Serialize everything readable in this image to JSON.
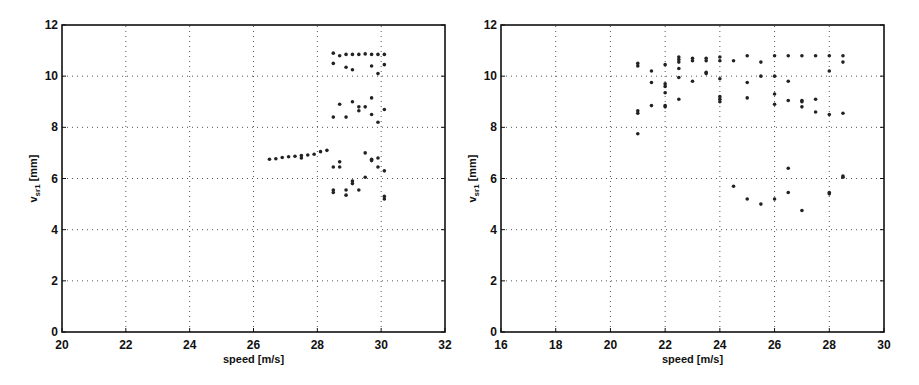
{
  "chart_data": [
    {
      "type": "scatter",
      "title": "",
      "xlabel": "speed [m/s]",
      "ylabel_main": "v",
      "ylabel_sub": "sr1",
      "ylabel_unit": "[mm]",
      "xlim": [
        20,
        32
      ],
      "ylim": [
        0,
        12
      ],
      "xticks": [
        20,
        22,
        24,
        26,
        28,
        30,
        32
      ],
      "yticks": [
        0,
        2,
        4,
        6,
        8,
        10,
        12
      ],
      "grid": true,
      "points": [
        [
          26.5,
          6.75
        ],
        [
          26.7,
          6.77
        ],
        [
          26.9,
          6.82
        ],
        [
          27.1,
          6.85
        ],
        [
          27.3,
          6.87
        ],
        [
          27.5,
          6.9
        ],
        [
          27.5,
          6.8
        ],
        [
          27.7,
          6.92
        ],
        [
          27.9,
          6.95
        ],
        [
          28.1,
          7.05
        ],
        [
          28.3,
          7.1
        ],
        [
          28.5,
          10.9
        ],
        [
          28.7,
          10.8
        ],
        [
          28.9,
          10.85
        ],
        [
          29.1,
          10.85
        ],
        [
          29.3,
          10.85
        ],
        [
          29.5,
          10.87
        ],
        [
          29.7,
          10.85
        ],
        [
          29.9,
          10.85
        ],
        [
          30.1,
          10.85
        ],
        [
          28.5,
          10.5
        ],
        [
          28.9,
          10.35
        ],
        [
          29.1,
          10.25
        ],
        [
          29.7,
          10.4
        ],
        [
          29.9,
          10.1
        ],
        [
          30.1,
          10.45
        ],
        [
          28.5,
          8.4
        ],
        [
          28.7,
          8.9
        ],
        [
          28.9,
          8.4
        ],
        [
          29.1,
          9.0
        ],
        [
          29.3,
          8.8
        ],
        [
          29.3,
          8.65
        ],
        [
          29.5,
          8.8
        ],
        [
          29.7,
          9.15
        ],
        [
          29.7,
          8.5
        ],
        [
          29.9,
          8.2
        ],
        [
          30.1,
          8.7
        ],
        [
          28.5,
          6.45
        ],
        [
          28.7,
          6.65
        ],
        [
          28.7,
          6.45
        ],
        [
          29.5,
          7.0
        ],
        [
          29.7,
          6.75
        ],
        [
          29.7,
          6.7
        ],
        [
          29.9,
          6.8
        ],
        [
          29.9,
          6.45
        ],
        [
          30.1,
          6.3
        ],
        [
          28.5,
          5.55
        ],
        [
          28.5,
          5.45
        ],
        [
          28.9,
          5.55
        ],
        [
          28.9,
          5.35
        ],
        [
          29.1,
          5.9
        ],
        [
          29.1,
          5.8
        ],
        [
          29.3,
          5.55
        ],
        [
          29.5,
          6.05
        ],
        [
          30.1,
          5.3
        ],
        [
          30.1,
          5.2
        ]
      ]
    },
    {
      "type": "scatter",
      "title": "",
      "xlabel": "speed [m/s]",
      "ylabel_main": "v",
      "ylabel_sub": "sr1",
      "ylabel_unit": "[mm]",
      "xlim": [
        16,
        30
      ],
      "ylim": [
        0,
        12
      ],
      "xticks": [
        16,
        18,
        20,
        22,
        24,
        26,
        28,
        30
      ],
      "yticks": [
        0,
        2,
        4,
        6,
        8,
        10,
        12
      ],
      "grid": true,
      "points": [
        [
          21,
          10.5
        ],
        [
          21,
          10.4
        ],
        [
          21,
          8.65
        ],
        [
          21,
          8.55
        ],
        [
          21,
          7.75
        ],
        [
          21.5,
          10.2
        ],
        [
          21.5,
          9.75
        ],
        [
          21.5,
          8.85
        ],
        [
          22,
          10.45
        ],
        [
          22,
          9.7
        ],
        [
          22,
          9.6
        ],
        [
          22,
          9.35
        ],
        [
          22,
          8.85
        ],
        [
          22,
          8.8
        ],
        [
          22.5,
          10.75
        ],
        [
          22.5,
          10.65
        ],
        [
          22.5,
          10.55
        ],
        [
          22.5,
          10.3
        ],
        [
          22.5,
          9.95
        ],
        [
          22.5,
          9.1
        ],
        [
          23,
          10.7
        ],
        [
          23,
          10.6
        ],
        [
          23,
          9.8
        ],
        [
          23.5,
          10.7
        ],
        [
          23.5,
          10.6
        ],
        [
          23.5,
          10.15
        ],
        [
          23.5,
          10.1
        ],
        [
          24,
          10.75
        ],
        [
          24,
          10.6
        ],
        [
          24,
          9.9
        ],
        [
          24,
          9.2
        ],
        [
          24,
          9.1
        ],
        [
          24,
          9.0
        ],
        [
          24.5,
          10.6
        ],
        [
          24.5,
          5.7
        ],
        [
          25,
          10.8
        ],
        [
          25,
          9.75
        ],
        [
          25,
          9.15
        ],
        [
          25,
          5.2
        ],
        [
          25.5,
          10.55
        ],
        [
          25.5,
          10.0
        ],
        [
          25.5,
          5.0
        ],
        [
          26,
          10.8
        ],
        [
          26,
          10.0
        ],
        [
          26,
          9.3
        ],
        [
          26,
          8.9
        ],
        [
          26,
          5.2
        ],
        [
          26.5,
          10.8
        ],
        [
          26.5,
          9.8
        ],
        [
          26.5,
          9.05
        ],
        [
          26.5,
          6.4
        ],
        [
          26.5,
          5.45
        ],
        [
          27,
          10.8
        ],
        [
          27,
          9.05
        ],
        [
          27,
          9.0
        ],
        [
          27,
          8.8
        ],
        [
          27,
          4.75
        ],
        [
          27.5,
          10.8
        ],
        [
          27.5,
          9.1
        ],
        [
          27.5,
          8.6
        ],
        [
          28,
          10.8
        ],
        [
          28,
          10.2
        ],
        [
          28,
          8.5
        ],
        [
          28,
          5.45
        ],
        [
          28,
          5.4
        ],
        [
          28.5,
          10.8
        ],
        [
          28.5,
          10.55
        ],
        [
          28.5,
          8.55
        ],
        [
          28.5,
          6.1
        ],
        [
          28.5,
          6.05
        ]
      ]
    }
  ]
}
